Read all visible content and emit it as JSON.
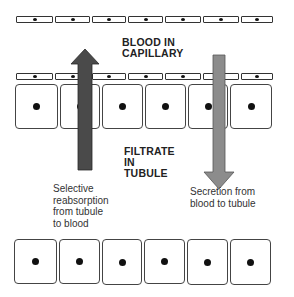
{
  "labels": {
    "blood": [
      "BLOOD IN",
      "CAPILLARY"
    ],
    "filtrate": [
      "FILTRATE",
      "IN",
      "TUBULE"
    ],
    "reabsorption": [
      "Selective",
      "reabsorption",
      "from tubule",
      "to blood"
    ],
    "secretion": [
      "Secretion from",
      "blood to tubule"
    ]
  },
  "colors": {
    "reabsorption_arrow": "#4a4a4a",
    "secretion_arrow": "#8c8c8c",
    "cell_border": "#333333"
  },
  "structure": {
    "capillary_cell_rows": 2,
    "capillary_cells_per_row": 7,
    "tubule_cell_rows": 2,
    "tubule_cells_per_row": 6
  }
}
